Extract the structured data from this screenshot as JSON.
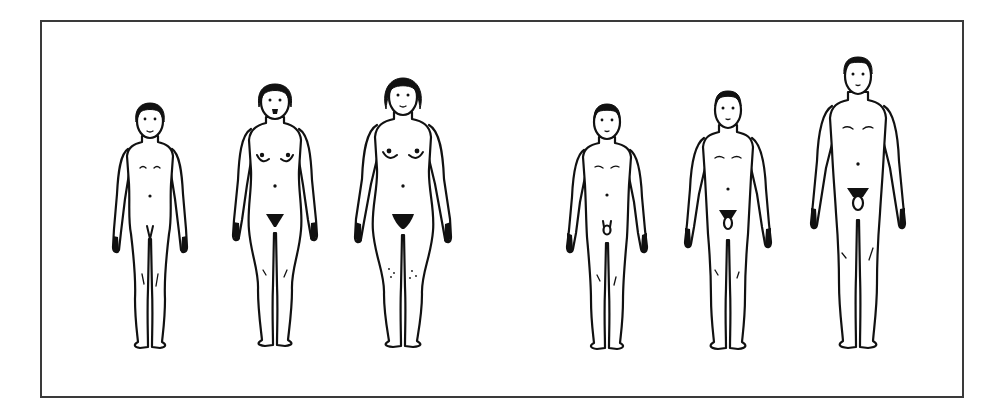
{
  "figure": {
    "groups": [
      {
        "name": "female-series",
        "figures": [
          {
            "id": "female-1",
            "stage": "prepubertal",
            "cx": 150,
            "head_top": 103,
            "feet": 345
          },
          {
            "id": "female-2",
            "stage": "pubertal",
            "cx": 275,
            "head_top": 84,
            "feet": 345
          },
          {
            "id": "female-3",
            "stage": "adult",
            "cx": 403,
            "head_top": 78,
            "feet": 346
          }
        ]
      },
      {
        "name": "male-series",
        "figures": [
          {
            "id": "male-1",
            "stage": "prepubertal",
            "cx": 607,
            "head_top": 104,
            "feet": 346
          },
          {
            "id": "male-2",
            "stage": "pubertal",
            "cx": 728,
            "head_top": 91,
            "feet": 350
          },
          {
            "id": "male-3",
            "stage": "adult",
            "cx": 858,
            "head_top": 57,
            "feet": 351
          }
        ]
      }
    ],
    "frame": {
      "left": 40,
      "top": 20,
      "right": 962,
      "bottom": 396
    },
    "colors": {
      "line": "#111111",
      "frame": "#3a3a3a",
      "background": "#ffffff"
    }
  }
}
